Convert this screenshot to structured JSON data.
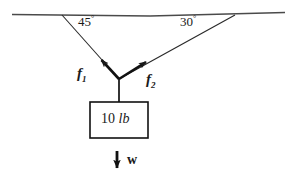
{
  "figure": {
    "kind": "free-body-force-diagram",
    "background_color": "#ffffff",
    "stroke_color": "#1a1a1a",
    "ceiling": {
      "name": "ceiling-line",
      "x1": 12,
      "y1": 14,
      "x2": 285,
      "y2": 13
    },
    "anchors": {
      "left": {
        "x": 62,
        "y": 15
      },
      "right": {
        "x": 235,
        "y": 15
      }
    },
    "knot": {
      "x": 119,
      "y": 79
    },
    "angles": [
      {
        "id": "left-angle",
        "value": "45",
        "degree_symbol": "°",
        "text": "45°",
        "x": 78,
        "y": 15
      },
      {
        "id": "right-angle",
        "value": "30",
        "degree_symbol": "°",
        "text": "30°",
        "x": 180,
        "y": 15
      }
    ],
    "forces": [
      {
        "id": "f1",
        "symbol": "f",
        "subscript": "1",
        "text": "f1",
        "label_x": 77,
        "label_y": 66,
        "arrow": {
          "x1": 119,
          "y1": 79,
          "x2": 99,
          "y2": 57
        },
        "direction": "up-left"
      },
      {
        "id": "f2",
        "symbol": "f",
        "subscript": "2",
        "text": "f2",
        "label_x": 145,
        "label_y": 72,
        "arrow": {
          "x1": 119,
          "y1": 79,
          "x2": 149,
          "y2": 60
        },
        "direction": "up-right"
      }
    ],
    "cord": {
      "x1": 119,
      "y1": 79,
      "x2": 119,
      "y2": 102
    },
    "block": {
      "name": "mass-block",
      "label": "10 lb",
      "number": "10",
      "unit": "lb",
      "x": 90,
      "y": 102,
      "width": 58,
      "height": 36
    },
    "weight": {
      "name": "weight-vector",
      "label": "w",
      "arrow": {
        "x1": 117,
        "y1": 151,
        "x2": 117,
        "y2": 172
      },
      "label_x": 127,
      "label_y": 153
    }
  }
}
